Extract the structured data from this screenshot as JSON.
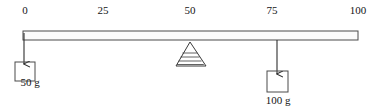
{
  "figure": {
    "background_color": "#ffffff",
    "line_color": "#333333",
    "text_color": "#141414"
  },
  "ruler": {
    "name": "meter-stick",
    "left_x": 23,
    "right_x": 358,
    "top_y": 31,
    "bottom_y": 40,
    "fill_color": "#fbfbfb",
    "stroke_color": "#4a4a4a"
  },
  "scale": {
    "ticks": [
      {
        "value": "0",
        "x": 25
      },
      {
        "value": "25",
        "x": 103
      },
      {
        "value": "50",
        "x": 190
      },
      {
        "value": "75",
        "x": 272
      },
      {
        "value": "100",
        "x": 358
      }
    ]
  },
  "fulcrum": {
    "name": "fulcrum-triangle",
    "position_value": "50",
    "apex_x": 190,
    "apex_y": 42,
    "base_left_x": 176,
    "base_right_x": 206,
    "base_y": 66,
    "hatch_lines": 4
  },
  "masses": [
    {
      "name": "mass-50g",
      "label": "50 g",
      "position_value": "0",
      "arrow_x": 24,
      "arrow_top_y": 36,
      "arrow_tip_y": 64,
      "box_x": 15,
      "box_y": 62,
      "box_w": 20,
      "box_h": 19,
      "label_x": 30,
      "label_y": 76
    },
    {
      "name": "mass-100g",
      "label": "100 g",
      "position_value": "75",
      "arrow_x": 277,
      "arrow_top_y": 40,
      "arrow_tip_y": 74,
      "box_x": 267,
      "box_y": 71,
      "box_w": 21,
      "box_h": 21,
      "label_x": 278,
      "label_y": 95
    }
  ]
}
